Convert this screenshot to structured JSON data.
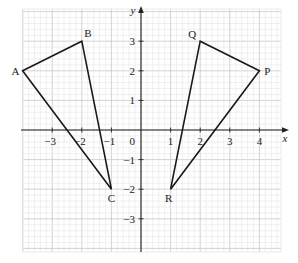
{
  "diagram": {
    "type": "coordinate-grid",
    "axes": {
      "x_label": "x",
      "y_label": "y",
      "origin_label": "0",
      "x_ticks": [
        {
          "value": -3,
          "label": "−3"
        },
        {
          "value": -2,
          "label": "−2"
        },
        {
          "value": -1,
          "label": "−1"
        },
        {
          "value": 1,
          "label": "1"
        },
        {
          "value": 2,
          "label": "2"
        },
        {
          "value": 3,
          "label": "3"
        },
        {
          "value": 4,
          "label": "4"
        }
      ],
      "y_ticks": [
        {
          "value": 3,
          "label": "3"
        },
        {
          "value": 2,
          "label": "2"
        },
        {
          "value": 1,
          "label": "1"
        },
        {
          "value": -1,
          "label": "−1"
        },
        {
          "value": -2,
          "label": "−2"
        },
        {
          "value": -3,
          "label": "−3"
        }
      ],
      "x_range": [
        -4,
        5
      ],
      "y_range": [
        -4.2,
        4.2
      ]
    },
    "shapes": [
      {
        "name": "triangle-ABC",
        "vertices": [
          {
            "label": "A",
            "x": -4,
            "y": 2
          },
          {
            "label": "B",
            "x": -2,
            "y": 3
          },
          {
            "label": "C",
            "x": -1,
            "y": -2
          }
        ]
      },
      {
        "name": "triangle-PQR",
        "vertices": [
          {
            "label": "P",
            "x": 4,
            "y": 2
          },
          {
            "label": "Q",
            "x": 2,
            "y": 3
          },
          {
            "label": "R",
            "x": 1,
            "y": -2
          }
        ]
      }
    ],
    "colors": {
      "grid_minor": "#e6e6e6",
      "grid_major": "#c8c8c8",
      "axis": "#222222",
      "shape_stroke": "#1a1a1a"
    }
  }
}
